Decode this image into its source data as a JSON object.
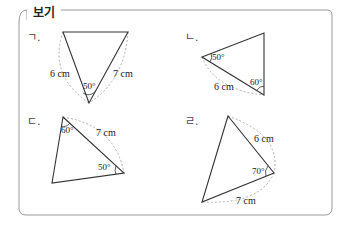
{
  "box": {
    "title": "보기",
    "border_color": "#9a9a9a",
    "line_color": "#333333",
    "dash_color": "#9a9a9a"
  },
  "items": [
    {
      "label": "ㄱ.",
      "side_left": "6 cm",
      "side_right": "7 cm",
      "angle": "50°"
    },
    {
      "label": "ㄴ.",
      "side": "6 cm",
      "angle_left": "50°",
      "angle_right": "60°"
    },
    {
      "label": "ㄷ.",
      "side": "7 cm",
      "angle_top": "60°",
      "angle_right": "50°"
    },
    {
      "label": "ㄹ.",
      "side_top": "6 cm",
      "side_bottom": "7 cm",
      "angle": "70°"
    }
  ]
}
